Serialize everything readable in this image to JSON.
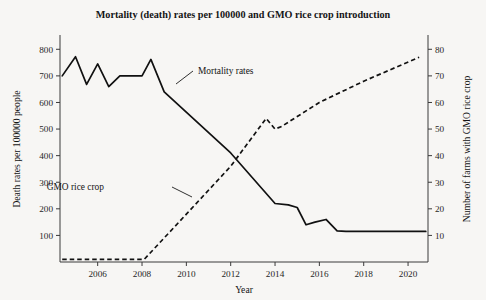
{
  "chart_data": {
    "type": "line",
    "title": "Mortality (death) rates per 100000 and GMO rice crop introduction",
    "xlabel": "Year",
    "ylabel": "Death rates per 100000 people",
    "y2label": "Number of farms with GMO rice crop",
    "grid": false,
    "legend_position": "inline-annotations",
    "xlim": [
      2004.3,
      2020.9
    ],
    "ylim": [
      0,
      850
    ],
    "y2lim": [
      0,
      85
    ],
    "xticks": [
      2006,
      2008,
      2010,
      2012,
      2014,
      2016,
      2018,
      2020
    ],
    "xtick_labels": [
      "2006",
      "2008",
      "2010",
      "2012",
      "2014",
      "2016",
      "2018",
      "2020"
    ],
    "yticks": [
      100,
      200,
      300,
      400,
      500,
      600,
      700,
      800
    ],
    "ytick_labels": [
      "100",
      "200",
      "300",
      "400",
      "500",
      "600",
      "700",
      "800"
    ],
    "y2ticks": [
      10,
      20,
      30,
      40,
      50,
      60,
      70,
      80
    ],
    "y2tick_labels": [
      "10",
      "20",
      "30",
      "40",
      "50",
      "60",
      "70",
      "80"
    ],
    "series": [
      {
        "name": "Mortality rates",
        "axis": "left",
        "style": "solid",
        "x": [
          2004.4,
          2005.0,
          2005.5,
          2006.0,
          2006.5,
          2007.0,
          2008.0,
          2008.4,
          2009.0,
          2012.0,
          2014.0,
          2014.6,
          2015.0,
          2015.4,
          2015.8,
          2016.3,
          2016.8,
          2017.2,
          2020.8
        ],
        "values": [
          700,
          772,
          668,
          745,
          660,
          700,
          700,
          762,
          640,
          410,
          220,
          215,
          205,
          140,
          150,
          160,
          117,
          115,
          115
        ]
      },
      {
        "name": "GMO rice crop",
        "axis": "right",
        "style": "dashed",
        "x": [
          2004.4,
          2008.1,
          2010.0,
          2012.0,
          2013.6,
          2014.0,
          2014.3,
          2016.0,
          2018.0,
          2020.5
        ],
        "values": [
          1,
          1,
          18,
          36,
          54,
          50,
          51,
          60,
          68,
          77
        ]
      }
    ],
    "annotations": [
      {
        "label": "Mortality rates",
        "text_x": 198,
        "text_y": 74,
        "leader": [
          [
            193,
            71
          ],
          [
            176,
            84
          ]
        ]
      },
      {
        "label": "GMO rice crop",
        "text_x": 104,
        "text_y": 190,
        "leader": [
          [
            172,
            187
          ],
          [
            192,
            197
          ]
        ]
      }
    ]
  },
  "geometry": {
    "plot_left": 60,
    "plot_right": 428,
    "plot_top": 36,
    "plot_bottom": 262,
    "title_x": 243,
    "title_y": 18
  }
}
